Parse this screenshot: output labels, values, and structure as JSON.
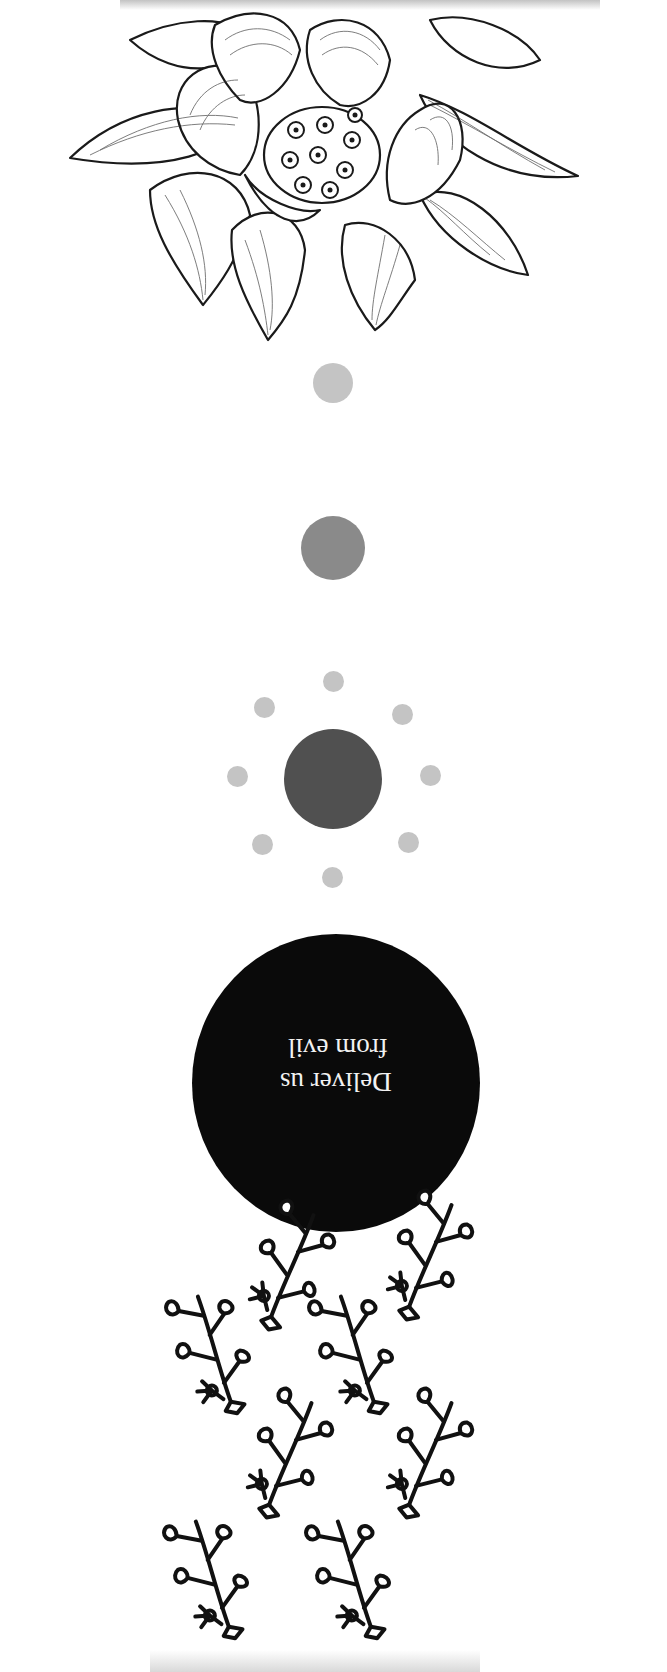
{
  "illustration": {
    "orientation": "rotated-180",
    "circle_text": {
      "line1": "Deliver us",
      "line2": "from evil"
    },
    "colors": {
      "background": "#ffffff",
      "ink": "#111111",
      "dot_light": "#c4c4c4",
      "dot_mid": "#8a8a8a",
      "dot_dark": "#505050",
      "big_circle": "#0a0a0a",
      "text": "#f2f2f2"
    },
    "elements": [
      "lotus-flower-drawing",
      "small-light-dot",
      "medium-gray-dot",
      "dark-dot-with-ring-of-eight-light-dots",
      "black-circle-with-text",
      "leafy-branch-pattern"
    ]
  }
}
